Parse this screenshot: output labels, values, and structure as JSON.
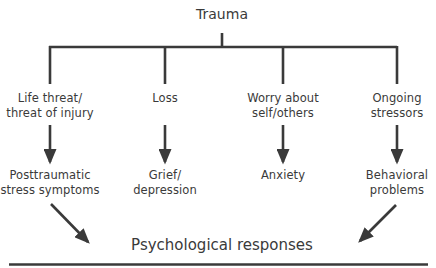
{
  "diagram": {
    "root": {
      "label": "Trauma"
    },
    "causes": [
      {
        "lines": [
          "Life threat/",
          "threat of injury"
        ]
      },
      {
        "lines": [
          "Loss"
        ]
      },
      {
        "lines": [
          "Worry about",
          "self/others"
        ]
      },
      {
        "lines": [
          "Ongoing",
          "stressors"
        ]
      }
    ],
    "effects": [
      {
        "lines": [
          "Posttraumatic",
          "stress symptoms"
        ]
      },
      {
        "lines": [
          "Grief/",
          "depression"
        ]
      },
      {
        "lines": [
          "Anxiety"
        ]
      },
      {
        "lines": [
          "Behavioral",
          "problems"
        ]
      }
    ],
    "outcome": {
      "label": "Psychological responses"
    },
    "colors": {
      "line": "#3a3a3a",
      "text": "#3a3a3a",
      "background": "#ffffff"
    }
  }
}
